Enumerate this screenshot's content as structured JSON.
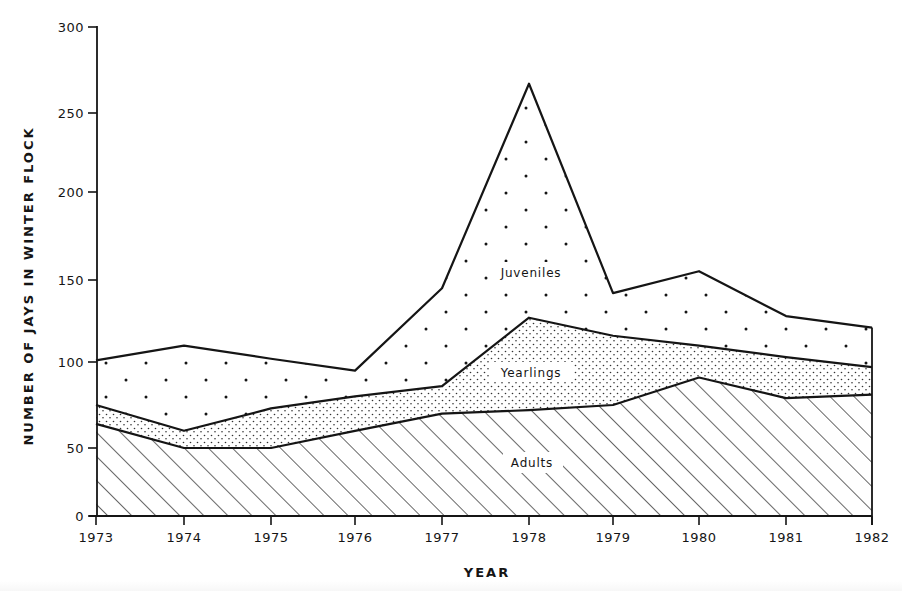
{
  "chart_data": {
    "type": "area",
    "stacked": true,
    "title": "",
    "xlabel": "YEAR",
    "ylabel": "NUMBER OF JAYS IN WINTER FLOCK",
    "x": [
      1973,
      1974,
      1975,
      1976,
      1977,
      1978,
      1979,
      1980,
      1981,
      1982
    ],
    "ylim": [
      0,
      300
    ],
    "yticks": [
      0,
      50,
      100,
      150,
      200,
      250,
      300
    ],
    "grid": false,
    "legend": "inline labels",
    "series": [
      {
        "name": "Adults",
        "pattern": "diagonal-hatch",
        "values": [
          64,
          50,
          50,
          60,
          70,
          72,
          75,
          91,
          79,
          81
        ]
      },
      {
        "name": "Yearlings",
        "pattern": "fine-stipple",
        "values": [
          11,
          10,
          23,
          20,
          16,
          55,
          41,
          19,
          24,
          16
        ]
      },
      {
        "name": "Juveniles",
        "pattern": "sparse-dots",
        "values": [
          26,
          50,
          29,
          15,
          59,
          140,
          26,
          45,
          25,
          24
        ]
      }
    ],
    "cumulative_totals": [
      101,
      110,
      102,
      95,
      145,
      267,
      142,
      155,
      128,
      121
    ],
    "annotations": [
      {
        "text": "Juveniles",
        "x": 1978,
        "y": 148
      },
      {
        "text": "Yearlings",
        "x": 1978,
        "y": 88
      },
      {
        "text": "Adults",
        "x": 1978,
        "y": 31
      }
    ]
  },
  "labels": {
    "xlabel": "YEAR",
    "ylabel": "NUMBER OF JAYS IN WINTER FLOCK",
    "juveniles": "Juveniles",
    "yearlings": "Yearlings",
    "adults": "Adults"
  },
  "colors": {
    "ink": "#151515",
    "background": "#ffffff"
  }
}
